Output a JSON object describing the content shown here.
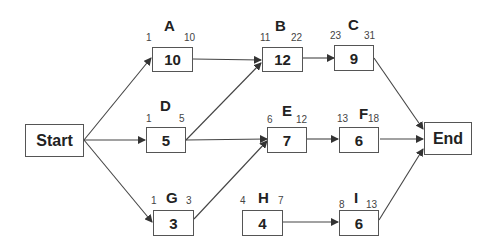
{
  "diagram": {
    "type": "activity-on-node network",
    "start": {
      "label": "Start"
    },
    "end": {
      "label": "End"
    },
    "activities": [
      {
        "id": "A",
        "duration": "10",
        "es": "1",
        "ef": "10"
      },
      {
        "id": "B",
        "duration": "12",
        "es": "11",
        "ef": "22"
      },
      {
        "id": "C",
        "duration": "9",
        "es": "23",
        "ef": "31"
      },
      {
        "id": "D",
        "duration": "5",
        "es": "1",
        "ef": "5"
      },
      {
        "id": "E",
        "duration": "7",
        "es": "6",
        "ef": "12"
      },
      {
        "id": "F",
        "duration": "6",
        "es": "13",
        "ef": "18"
      },
      {
        "id": "G",
        "duration": "3",
        "es": "1",
        "ef": "3"
      },
      {
        "id": "H",
        "duration": "4",
        "es": "4",
        "ef": "7"
      },
      {
        "id": "I",
        "duration": "6",
        "es": "8",
        "ef": "13"
      }
    ],
    "edges": [
      [
        "Start",
        "A"
      ],
      [
        "Start",
        "D"
      ],
      [
        "Start",
        "G"
      ],
      [
        "A",
        "B"
      ],
      [
        "D",
        "B"
      ],
      [
        "B",
        "C"
      ],
      [
        "C",
        "End"
      ],
      [
        "D",
        "E"
      ],
      [
        "G",
        "E"
      ],
      [
        "E",
        "F"
      ],
      [
        "F",
        "End"
      ],
      [
        "H",
        "I"
      ],
      [
        "I",
        "End"
      ]
    ]
  }
}
